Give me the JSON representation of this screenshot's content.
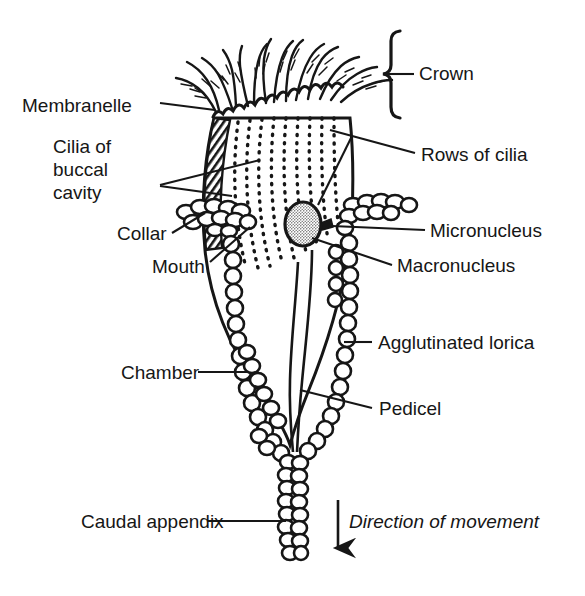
{
  "figure": {
    "background_color": "#ffffff",
    "ink_color": "#161616"
  },
  "labels": {
    "crown": "Crown",
    "membranelle": "Membranelle",
    "cilia_of_buccal_cavity": "Cilia of\nbuccal\ncavity",
    "rows_of_cilia": "Rows of cilia",
    "collar": "Collar",
    "mouth": "Mouth",
    "micronucleus": "Micronucleus",
    "macronucleus": "Macronucleus",
    "agglutinated_lorica": "Agglutinated lorica",
    "chamber": "Chamber",
    "pedicel": "Pedicel",
    "caudal_appendix": "Caudal appendix",
    "direction_of_movement": "Direction of movement"
  },
  "parts": {
    "crown_icon": "ciliary-crown",
    "bracket_icon": "curly-brace",
    "arrow_icon": "down-arrow",
    "macronucleus_icon": "stippled-oval",
    "lorica_icon": "granular-wall",
    "buccal_icon": "hatched-band",
    "cilia_rows_icon": "dotted-rows"
  }
}
